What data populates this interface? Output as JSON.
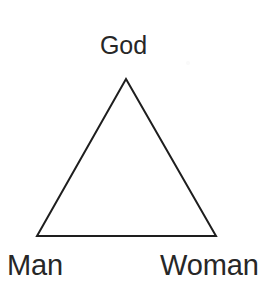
{
  "diagram": {
    "type": "triangle-relationship-diagram",
    "background_color": "#ffffff",
    "stroke_color": "#1e1e1e",
    "stroke_width": 2,
    "text_color": "#272727",
    "width": 279,
    "height": 288,
    "shape": {
      "name": "triangle",
      "vertices": [
        {
          "id": "apex",
          "x": 126,
          "y": 79
        },
        {
          "id": "bottom-left",
          "x": 37,
          "y": 236
        },
        {
          "id": "bottom-right",
          "x": 216,
          "y": 236
        }
      ],
      "points_attr": "126,79 216,236 37,236"
    },
    "labels": [
      {
        "id": "god",
        "text": "God",
        "position": "top",
        "font_size": 25
      },
      {
        "id": "man",
        "text": "Man",
        "position": "bottom-left",
        "font_size": 29
      },
      {
        "id": "woman",
        "text": "Woman",
        "position": "bottom-right",
        "font_size": 29
      }
    ]
  }
}
